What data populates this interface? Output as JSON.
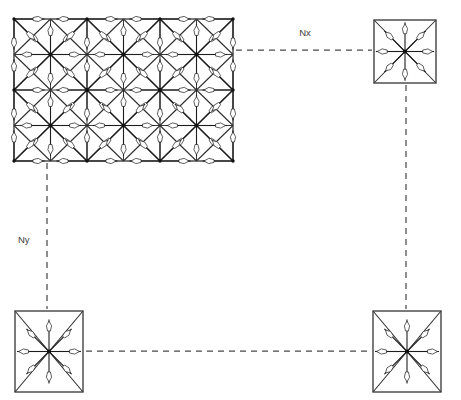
{
  "figure": {
    "kind": "mesh-decomposition-diagram",
    "background_color": "#ffffff",
    "line_color": "#2b2b2b",
    "dash_color": "#4a4a4a",
    "arrow_fill": "#ffffff",
    "node_color": "#111111",
    "width": 461,
    "height": 400
  },
  "labels": {
    "nx": "Nx",
    "ny": "Ny"
  },
  "label_positions": {
    "nx": {
      "x": 305,
      "y": 33
    },
    "ny": {
      "x": 18,
      "y": 240
    }
  },
  "main_block": {
    "name": "main-mesh-block",
    "x": 14,
    "y": 19,
    "width": 219,
    "height": 142,
    "cols": 6,
    "rows": 4,
    "cell_w": 36.5,
    "cell_h": 35.5,
    "node_pattern": "checkerboard",
    "spokes_per_node": 8,
    "spoke_directions": [
      "E",
      "NE",
      "N",
      "NW",
      "W",
      "SW",
      "S",
      "SE"
    ]
  },
  "satellite_blocks": [
    {
      "name": "satellite-top-right",
      "x": 374,
      "y": 20,
      "width": 62,
      "height": 63,
      "cols": 1,
      "rows": 1,
      "spokes_per_node": 8
    },
    {
      "name": "satellite-bottom-left",
      "x": 15,
      "y": 311,
      "width": 68,
      "height": 81,
      "cols": 1,
      "rows": 1,
      "spokes_per_node": 8
    },
    {
      "name": "satellite-bottom-right",
      "x": 373,
      "y": 311,
      "width": 68,
      "height": 81,
      "cols": 1,
      "rows": 1,
      "spokes_per_node": 8
    }
  ],
  "connectors": [
    {
      "name": "connector-nx-top",
      "orientation": "horizontal",
      "label": "Nx",
      "x1": 236,
      "y1": 50,
      "x2": 372,
      "y2": 50
    },
    {
      "name": "connector-ny-left",
      "orientation": "vertical",
      "label": "Ny",
      "x1": 47,
      "y1": 163,
      "x2": 47,
      "y2": 309
    },
    {
      "name": "connector-right-vertical",
      "orientation": "vertical",
      "label": "",
      "x1": 406,
      "y1": 85,
      "x2": 406,
      "y2": 309
    },
    {
      "name": "connector-bottom-horizontal",
      "orientation": "horizontal",
      "label": "",
      "x1": 86,
      "y1": 351,
      "x2": 371,
      "y2": 351
    }
  ]
}
